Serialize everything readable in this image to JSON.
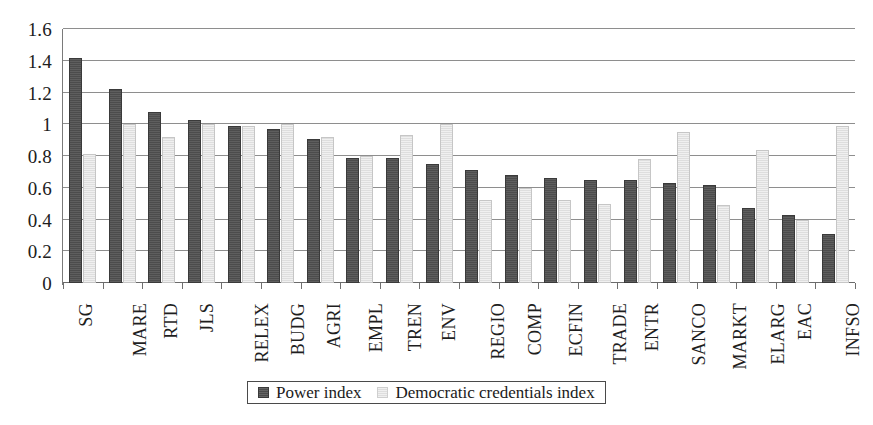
{
  "chart_data": {
    "type": "bar",
    "title": "",
    "subtitle": "",
    "xlabel": "",
    "ylabel": "",
    "ylim": [
      0,
      1.6
    ],
    "ytick_labels": [
      "1.6",
      "1.4",
      "1.2",
      "1",
      "0.8",
      "0.6",
      "0.4",
      "0.2",
      "0"
    ],
    "ytick_values": [
      1.6,
      1.4,
      1.2,
      1.0,
      0.8,
      0.6,
      0.4,
      0.2,
      0
    ],
    "grid": "horizontal",
    "legend_position": "bottom",
    "categories": [
      "SG",
      "MARE",
      "RTD",
      "JLS",
      "RELEX",
      "BUDG",
      "AGRI",
      "EMPL",
      "TREN",
      "ENV",
      "REGIO",
      "COMP",
      "ECFIN",
      "TRADE",
      "ENTR",
      "SANCO",
      "MARKT",
      "ELARG",
      "EAC",
      "INFSO"
    ],
    "series": [
      {
        "name": "Power index",
        "color": "#4c4c4c",
        "values": [
          1.42,
          1.22,
          1.08,
          1.03,
          0.99,
          0.97,
          0.91,
          0.79,
          0.79,
          0.75,
          0.71,
          0.68,
          0.66,
          0.65,
          0.65,
          0.63,
          0.62,
          0.47,
          0.43,
          0.31
        ]
      },
      {
        "name": "Democratic credentials index",
        "color": "#dedede",
        "values": [
          0.81,
          1.0,
          0.92,
          1.0,
          0.99,
          1.0,
          0.92,
          0.8,
          0.93,
          1.0,
          0.52,
          0.6,
          0.52,
          0.5,
          0.78,
          0.95,
          0.49,
          0.84,
          0.4,
          0.99
        ]
      }
    ]
  },
  "legend": {
    "entries": [
      {
        "label": "Power index",
        "swatch": "power"
      },
      {
        "label": "Democratic credentials index",
        "swatch": "democratic"
      }
    ]
  },
  "colors": {
    "power_index": "#4c4c4c",
    "democratic_credentials_index": "#dedede",
    "gridline": "#8e8e8e",
    "axis": "#7a7a7a",
    "background": "#ffffff",
    "text": "#1a1a1a"
  }
}
